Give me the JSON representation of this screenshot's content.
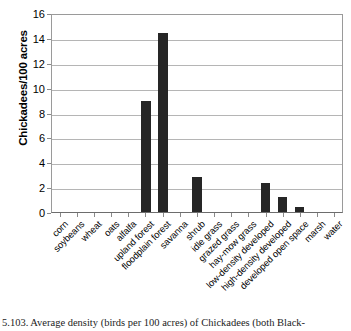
{
  "chart_data": {
    "type": "bar",
    "title": "",
    "xlabel": "",
    "ylabel": "Chickadees/100 acres",
    "ylim": [
      0,
      16
    ],
    "ytick_step": 2,
    "yticks": [
      16,
      14,
      12,
      10,
      8,
      6,
      4,
      2,
      0
    ],
    "grid": true,
    "legend": "none",
    "bar_color": "#262626",
    "categories": [
      "corn",
      "soybeans",
      "wheat",
      "oats",
      "alfalfa",
      "upland forest",
      "floodplain forest",
      "savanna",
      "shrub",
      "idle grass",
      "grazed grass",
      "hay-mow grass",
      "low-density developed",
      "high-density developed",
      "developed open space",
      "marsh",
      "water"
    ],
    "values": [
      0,
      0,
      0,
      0,
      0,
      8.9,
      14.4,
      0,
      2.8,
      0,
      0,
      0,
      2.35,
      1.2,
      0.4,
      0,
      0
    ]
  },
  "caption": {
    "text": "5.103.  Average density (birds per 100 acres) of Chickadees (both Black-"
  }
}
